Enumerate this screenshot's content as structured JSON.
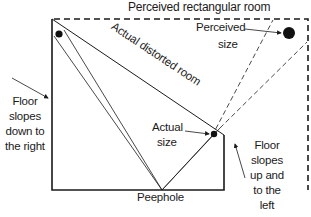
{
  "title": "Perceived rectangular room",
  "labels": {
    "distorted_room": "Actual distorted room",
    "perceived_size_line1": "Perceived",
    "perceived_size_line2": "size",
    "actual_size_line1": "Actual",
    "actual_size_line2": "size",
    "peephole": "Peephole",
    "floor_left": [
      "Floor",
      "slopes",
      "down to",
      "the right"
    ],
    "floor_right": [
      "Floor",
      "slopes",
      "up and",
      "to the",
      "left"
    ]
  },
  "colors": {
    "line": "#1a1a1a",
    "background": "#ffffff"
  }
}
